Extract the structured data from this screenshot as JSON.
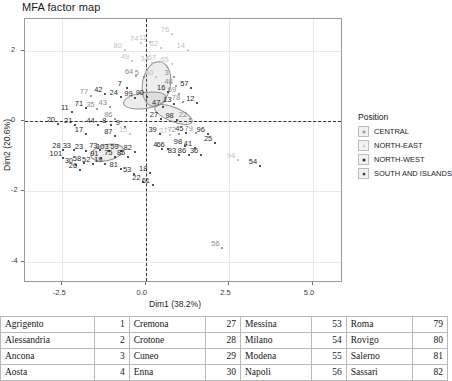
{
  "chart_data": {
    "type": "scatter",
    "title": "MFA factor map",
    "xlabel": "Dim1 (38.2%)",
    "ylabel": "Dim2 (20.6%)",
    "xlim": [
      -3.6,
      5.9
    ],
    "ylim": [
      -4.6,
      2.9
    ],
    "xticks": [
      "-2.5",
      "0.0",
      "2.5",
      "5.0"
    ],
    "xtick_values": [
      -2.5,
      0,
      2.5,
      5
    ],
    "yticks": [
      "2",
      "0",
      "-2",
      "-4"
    ],
    "ytick_values": [
      2,
      0,
      -2,
      -4
    ],
    "grid": true,
    "reference_lines": {
      "x": 0,
      "y": 0,
      "style": "dashed"
    },
    "legend_position": "right",
    "points": [
      {
        "id": "80",
        "x": -0.62,
        "y": 2.02,
        "g": "lt"
      },
      {
        "id": "74",
        "x": -0.13,
        "y": 2.22,
        "g": "lt"
      },
      {
        "id": "11",
        "x": 0.13,
        "y": 2.25,
        "g": "lt"
      },
      {
        "id": "76",
        "x": 0.79,
        "y": 2.48,
        "g": "lt"
      },
      {
        "id": "62",
        "x": 0.46,
        "y": 2.09,
        "g": "lt"
      },
      {
        "id": "14",
        "x": 1.26,
        "y": 2.02,
        "g": "lt"
      },
      {
        "id": "49",
        "x": -0.4,
        "y": 1.7,
        "g": "lt"
      },
      {
        "id": "34",
        "x": 0.18,
        "y": 1.66,
        "g": "lt"
      },
      {
        "id": "67",
        "x": 0.4,
        "y": 1.68,
        "g": "lt"
      },
      {
        "id": "65",
        "x": 0.78,
        "y": 1.62,
        "g": "lt"
      },
      {
        "id": "64",
        "x": -0.28,
        "y": 1.29,
        "g": "md"
      },
      {
        "id": "5",
        "x": -0.05,
        "y": 1.25,
        "g": "md"
      },
      {
        "id": "60",
        "x": 0.32,
        "y": 1.26,
        "g": "lt"
      },
      {
        "id": "3",
        "x": 0.84,
        "y": 1.25,
        "g": "md"
      },
      {
        "id": "48",
        "x": 0.9,
        "y": 0.99,
        "g": "md"
      },
      {
        "id": "57",
        "x": 1.37,
        "y": 0.95,
        "g": "dk"
      },
      {
        "id": "16",
        "x": 0.68,
        "y": 0.84,
        "g": "dk"
      },
      {
        "id": "69",
        "x": 1.0,
        "y": 0.77,
        "g": "md"
      },
      {
        "id": "7",
        "x": -0.56,
        "y": 0.93,
        "g": "dk"
      },
      {
        "id": "42",
        "x": -1.2,
        "y": 0.78,
        "g": "dk"
      },
      {
        "id": "77",
        "x": -1.63,
        "y": 0.7,
        "g": "md"
      },
      {
        "id": "24",
        "x": -0.74,
        "y": 0.67,
        "g": "dk"
      },
      {
        "id": "99",
        "x": -0.3,
        "y": 0.66,
        "g": "dk"
      },
      {
        "id": "90",
        "x": 0.04,
        "y": 0.67,
        "g": "dk"
      },
      {
        "id": "13",
        "x": 0.86,
        "y": 0.49,
        "g": "dk"
      },
      {
        "id": "78",
        "x": 1.12,
        "y": 0.55,
        "g": "md"
      },
      {
        "id": "12",
        "x": 1.55,
        "y": 0.5,
        "g": "dk"
      },
      {
        "id": "47",
        "x": 0.53,
        "y": 0.39,
        "g": "dk"
      },
      {
        "id": "71",
        "x": -1.78,
        "y": 0.36,
        "g": "dk"
      },
      {
        "id": "35",
        "x": -1.44,
        "y": 0.33,
        "g": "md"
      },
      {
        "id": "43",
        "x": -1.07,
        "y": 0.4,
        "g": "md"
      },
      {
        "id": "11b",
        "x": -2.2,
        "y": 0.26,
        "g": "dk"
      },
      {
        "id": "86",
        "x": -0.9,
        "y": 0.05,
        "g": "md"
      },
      {
        "id": "20",
        "x": -2.62,
        "y": -0.09,
        "g": "dk"
      },
      {
        "id": "21",
        "x": -2.1,
        "y": -0.1,
        "g": "dk"
      },
      {
        "id": "44",
        "x": -1.43,
        "y": -0.11,
        "g": "dk"
      },
      {
        "id": "8",
        "x": -1.02,
        "y": -0.12,
        "g": "dk"
      },
      {
        "id": "9",
        "x": -0.62,
        "y": -0.16,
        "g": "dk"
      },
      {
        "id": "27",
        "x": 0.46,
        "y": 0.06,
        "g": "dk"
      },
      {
        "id": "98c",
        "x": 0.93,
        "y": 0.04,
        "g": "dk"
      },
      {
        "id": "22b",
        "x": 1.33,
        "y": 0.05,
        "g": "md"
      },
      {
        "id": "17",
        "x": -1.78,
        "y": -0.37,
        "g": "dk"
      },
      {
        "id": "87",
        "x": -0.9,
        "y": -0.42,
        "g": "dk"
      },
      {
        "id": "15",
        "x": -0.46,
        "y": -0.36,
        "g": "lt"
      },
      {
        "id": "39",
        "x": 0.42,
        "y": -0.36,
        "g": "dk"
      },
      {
        "id": "37",
        "x": 0.74,
        "y": -0.4,
        "g": "lt"
      },
      {
        "id": "72",
        "x": 0.99,
        "y": -0.36,
        "g": "md"
      },
      {
        "id": "45",
        "x": 1.22,
        "y": -0.33,
        "g": "dk"
      },
      {
        "id": "79",
        "x": 1.5,
        "y": -0.34,
        "g": "md"
      },
      {
        "id": "28",
        "x": -2.45,
        "y": -0.83,
        "g": "dk"
      },
      {
        "id": "33",
        "x": -2.14,
        "y": -0.82,
        "g": "dk"
      },
      {
        "id": "23",
        "x": -1.78,
        "y": -0.84,
        "g": "dk"
      },
      {
        "id": "73",
        "x": -1.35,
        "y": -0.82,
        "g": "dk"
      },
      {
        "id": "103",
        "x": -1.08,
        "y": -0.86,
        "g": "dk"
      },
      {
        "id": "59",
        "x": -0.72,
        "y": -0.86,
        "g": "dk"
      },
      {
        "id": "82",
        "x": -0.32,
        "y": -0.87,
        "g": "dk"
      },
      {
        "id": "4",
        "x": 0.5,
        "y": -0.78,
        "g": "dk"
      },
      {
        "id": "66",
        "x": 0.66,
        "y": -0.8,
        "g": "dk"
      },
      {
        "id": "98",
        "x": 1.18,
        "y": -0.72,
        "g": "dk"
      },
      {
        "id": "41",
        "x": 1.48,
        "y": -0.76,
        "g": "dk"
      },
      {
        "id": "83",
        "x": 1.0,
        "y": -0.97,
        "g": "dk"
      },
      {
        "id": "86b",
        "x": 1.3,
        "y": -0.97,
        "g": "dk"
      },
      {
        "id": "101",
        "x": -2.47,
        "y": -1.06,
        "g": "dk"
      },
      {
        "id": "91",
        "x": -1.32,
        "y": -1.05,
        "g": "dk"
      },
      {
        "id": "75",
        "x": -0.9,
        "y": -1.02,
        "g": "dk"
      },
      {
        "id": "85",
        "x": -0.52,
        "y": -1.01,
        "g": "dk"
      },
      {
        "id": "30",
        "x": -2.08,
        "y": -1.24,
        "g": "dk"
      },
      {
        "id": "58",
        "x": -1.84,
        "y": -1.2,
        "g": "dk"
      },
      {
        "id": "52",
        "x": -1.56,
        "y": -1.22,
        "g": "dk"
      },
      {
        "id": "19",
        "x": -1.2,
        "y": -1.22,
        "g": "dk"
      },
      {
        "id": "26",
        "x": -1.96,
        "y": -1.4,
        "g": "dk"
      },
      {
        "id": "81",
        "x": -0.74,
        "y": -1.36,
        "g": "dk"
      },
      {
        "id": "53",
        "x": -0.34,
        "y": -1.5,
        "g": "dk"
      },
      {
        "id": "18",
        "x": 0.14,
        "y": -1.48,
        "g": "dk"
      },
      {
        "id": "22",
        "x": -0.06,
        "y": -1.74,
        "g": "dk"
      },
      {
        "id": "61",
        "x": 0.22,
        "y": -1.82,
        "g": "dk"
      },
      {
        "id": "25",
        "x": 2.08,
        "y": -0.62,
        "g": "dk"
      },
      {
        "id": "96",
        "x": 1.86,
        "y": -0.38,
        "g": "dk"
      },
      {
        "id": "36",
        "x": 1.66,
        "y": -0.95,
        "g": "dk"
      },
      {
        "id": "94",
        "x": 2.76,
        "y": -1.1,
        "g": "lt"
      },
      {
        "id": "54",
        "x": 3.42,
        "y": -1.27,
        "g": "dk"
      },
      {
        "id": "56",
        "x": 2.3,
        "y": -3.6,
        "g": "md"
      }
    ],
    "ellipses": [
      {
        "cx": -0.05,
        "cy": 0.6,
        "rx": 0.62,
        "ry": 0.22,
        "rot": -8
      },
      {
        "cx": 0.3,
        "cy": 1.1,
        "rx": 0.4,
        "ry": 0.62,
        "rot": 10
      },
      {
        "cx": 0.8,
        "cy": 0.22,
        "rx": 0.58,
        "ry": 0.18,
        "rot": 22
      },
      {
        "cx": -1.18,
        "cy": -0.86,
        "rx": 0.48,
        "ry": 0.22,
        "rot": -12
      }
    ],
    "legend": {
      "title": "Position",
      "items": [
        {
          "label": "CENTRAL",
          "tone": "#9a9a9a"
        },
        {
          "label": "NORTH-EAST",
          "tone": "#d2d2d2"
        },
        {
          "label": "NORTH-WEST",
          "tone": "#2c2c2c"
        },
        {
          "label": "SOUTH AND ISLANDS",
          "tone": "#4d4d4d"
        }
      ]
    }
  },
  "reference_table": {
    "rows": [
      [
        "Agrigento",
        "1",
        "Cremona",
        "27",
        "Messina",
        "53",
        "Roma",
        "79"
      ],
      [
        "Alessandria",
        "2",
        "Crotone",
        "28",
        "Milano",
        "54",
        "Rovigo",
        "80"
      ],
      [
        "Ancona",
        "3",
        "Cuneo",
        "29",
        "Modena",
        "55",
        "Salerno",
        "81"
      ],
      [
        "Aosta",
        "4",
        "Enna",
        "30",
        "Napoli",
        "56",
        "Sassari",
        "82"
      ]
    ]
  }
}
